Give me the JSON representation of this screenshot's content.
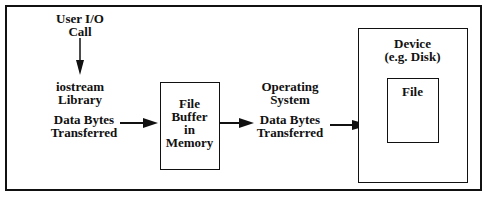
{
  "diagram": {
    "user_io": {
      "line1": "User I/O",
      "line2": "Call"
    },
    "iostream": {
      "line1": "iostream",
      "line2": "Library"
    },
    "data_left": {
      "line1": "Data Bytes",
      "line2": "Transferred"
    },
    "buffer": {
      "line1": "File",
      "line2": "Buffer",
      "line3": "in",
      "line4": "Memory"
    },
    "os": {
      "line1": "Operating",
      "line2": "System"
    },
    "data_right": {
      "line1": "Data Bytes",
      "line2": "Transferred"
    },
    "device": {
      "line1": "Device",
      "line2": "(e.g. Disk)"
    },
    "file": {
      "label": "File"
    }
  }
}
